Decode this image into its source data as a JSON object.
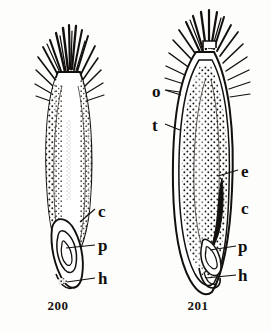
{
  "plate": {
    "kind": "botanical-line-illustration",
    "background_color": "#fdfdfc",
    "ink_color": "#120f0d",
    "figures": [
      {
        "number": "200",
        "view": "external whole seed with apical bristle tuft",
        "caption": "200",
        "labels": [
          {
            "key": "c",
            "text": "c",
            "side": "right"
          },
          {
            "key": "p",
            "text": "p",
            "side": "right"
          },
          {
            "key": "h",
            "text": "h",
            "side": "right"
          }
        ]
      },
      {
        "number": "201",
        "view": "longitudinal section of seed with apical bristle tuft",
        "caption": "201",
        "labels": [
          {
            "key": "o",
            "text": "o",
            "side": "left"
          },
          {
            "key": "t",
            "text": "t",
            "side": "left"
          },
          {
            "key": "e",
            "text": "e",
            "side": "right"
          },
          {
            "key": "c",
            "text": "c",
            "side": "right"
          },
          {
            "key": "p",
            "text": "p",
            "side": "right"
          },
          {
            "key": "h",
            "text": "h",
            "side": "right"
          }
        ]
      }
    ],
    "bottom_cropped_text": "—  —   —"
  }
}
